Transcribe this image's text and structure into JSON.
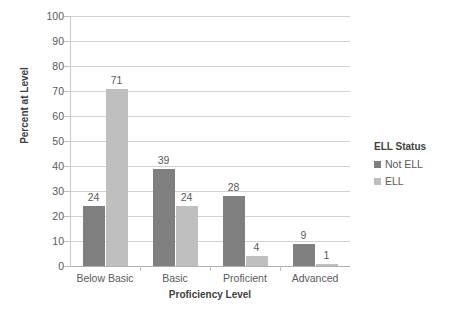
{
  "chart_data": {
    "type": "bar",
    "title": "",
    "xlabel": "Proficiency Level",
    "ylabel": "Percent at Level",
    "categories": [
      "Below Basic",
      "Basic",
      "Proficient",
      "Advanced"
    ],
    "series": [
      {
        "name": "Not ELL",
        "color": "#808080",
        "values": [
          24,
          39,
          28,
          9
        ]
      },
      {
        "name": "ELL",
        "color": "#bfbfbf",
        "values": [
          71,
          24,
          4,
          1
        ]
      }
    ],
    "ylim": [
      0,
      100
    ],
    "yticks": [
      0,
      10,
      20,
      30,
      40,
      50,
      60,
      70,
      80,
      90,
      100
    ],
    "ytick_labels": [
      "0",
      "10",
      "20",
      "30",
      "40",
      "50",
      "60",
      "70",
      "80",
      "90",
      "100"
    ],
    "grid": true,
    "grid_axis": "y",
    "data_labels": true,
    "legend": {
      "title": "ELL Status",
      "position": "right",
      "entries": [
        "Not ELL",
        "ELL"
      ]
    },
    "background_color": "#ffffff"
  }
}
